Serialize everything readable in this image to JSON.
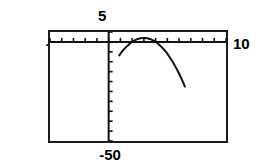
{
  "graph": {
    "labels": {
      "ymax": "5",
      "xmin": "-5",
      "xmax": "10",
      "ymin": "-50"
    }
  },
  "chart_data": {
    "type": "line",
    "title": "",
    "xlabel": "",
    "ylabel": "",
    "xlim": [
      -5,
      10
    ],
    "ylim": [
      -50,
      5
    ],
    "grid": false,
    "legend": null,
    "axis_ticks": {
      "x_tick_spacing": 1,
      "y_tick_spacing": 5,
      "x_tick_values": [
        -5,
        -4,
        -3,
        -2,
        -1,
        0,
        1,
        2,
        3,
        4,
        5,
        6,
        7,
        8,
        9,
        10
      ],
      "y_tick_values": [
        5,
        0,
        -5,
        -10,
        -15,
        -20,
        -25,
        -30,
        -35,
        -40,
        -45,
        -50
      ]
    },
    "series": [
      {
        "name": "parabola",
        "equation": "y = -2(x - 3)^2 + 2",
        "vertex": [
          3,
          2
        ],
        "opens": "down",
        "x": [
          0.9,
          1.1,
          1.3,
          1.5,
          1.7,
          1.9,
          2.1,
          2.3,
          2.5,
          2.7,
          2.9,
          3.1,
          3.3,
          3.5,
          3.7,
          3.9,
          4.1,
          4.3,
          4.5,
          4.7,
          4.9,
          5.1,
          5.3,
          5.5,
          5.7,
          5.9,
          6.1,
          6.3,
          6.5
        ],
        "values": [
          -6.8,
          -5.2,
          -3.8,
          -2.5,
          -1.4,
          -0.4,
          0.4,
          1.0,
          1.5,
          1.8,
          2.0,
          2.0,
          1.8,
          1.5,
          1.0,
          0.4,
          -0.4,
          -1.4,
          -2.5,
          -3.8,
          -5.2,
          -6.8,
          -8.6,
          -10.5,
          -12.6,
          -14.8,
          -17.2,
          -19.8,
          -22.5
        ]
      }
    ]
  }
}
